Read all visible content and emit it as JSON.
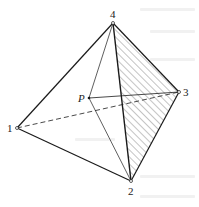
{
  "diagram": {
    "type": "tetrahedron",
    "vertices": [
      {
        "id": "1",
        "label": "1",
        "x": 17,
        "y": 128
      },
      {
        "id": "2",
        "label": "2",
        "x": 131,
        "y": 181
      },
      {
        "id": "3",
        "label": "3",
        "x": 179,
        "y": 92
      },
      {
        "id": "4",
        "label": "4",
        "x": 113,
        "y": 23
      }
    ],
    "point": {
      "id": "P",
      "label": "P",
      "x": 89,
      "y": 98
    },
    "edges_solid": [
      [
        "1",
        "4"
      ],
      [
        "1",
        "2"
      ],
      [
        "4",
        "2"
      ],
      [
        "4",
        "3"
      ],
      [
        "2",
        "3"
      ]
    ],
    "edges_dashed": [
      [
        "1",
        "3"
      ]
    ],
    "point_lines": [
      [
        "P",
        "4"
      ],
      [
        "P",
        "2"
      ],
      [
        "P",
        "3"
      ]
    ],
    "hatched_face": [
      "4",
      "2",
      "3"
    ],
    "colors": {
      "stroke": "#1a1a1a",
      "hatch": "#555555",
      "background": "#ffffff"
    }
  }
}
